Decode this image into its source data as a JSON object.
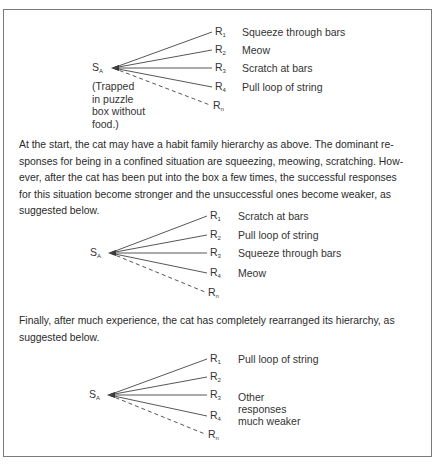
{
  "diagrams": [
    {
      "stimulus": {
        "base": "S",
        "sub": "A"
      },
      "note": [
        "(Trapped",
        "in puzzle",
        "box without",
        "food.)"
      ],
      "responses": [
        {
          "base": "R",
          "sub": "1",
          "text": "Squeeze through bars",
          "style": "solid"
        },
        {
          "base": "R",
          "sub": "2",
          "text": "Meow",
          "style": "solid"
        },
        {
          "base": "R",
          "sub": "3",
          "text": "Scratch at bars",
          "style": "solid"
        },
        {
          "base": "R",
          "sub": "4",
          "text": "Pull loop of string",
          "style": "solid"
        },
        {
          "base": "R",
          "sub": "n",
          "text": "",
          "style": "dashed"
        }
      ]
    },
    {
      "stimulus": {
        "base": "S",
        "sub": "A"
      },
      "responses": [
        {
          "base": "R",
          "sub": "1",
          "text": "Scratch at bars",
          "style": "solid"
        },
        {
          "base": "R",
          "sub": "2",
          "text": "Pull loop of string",
          "style": "solid"
        },
        {
          "base": "R",
          "sub": "3",
          "text": "Squeeze through bars",
          "style": "solid"
        },
        {
          "base": "R",
          "sub": "4",
          "text": "Meow",
          "style": "solid"
        },
        {
          "base": "R",
          "sub": "n",
          "text": "",
          "style": "dashed"
        }
      ]
    },
    {
      "stimulus": {
        "base": "S",
        "sub": "A"
      },
      "responses": [
        {
          "base": "R",
          "sub": "1",
          "text": "Pull loop of string",
          "style": "solid"
        },
        {
          "base": "R",
          "sub": "2",
          "text": "",
          "style": "solid"
        },
        {
          "base": "R",
          "sub": "3",
          "text": "",
          "style": "solid"
        },
        {
          "base": "R",
          "sub": "4",
          "text": "",
          "style": "solid"
        },
        {
          "base": "R",
          "sub": "n",
          "text": "",
          "style": "dashed"
        }
      ],
      "group_note": [
        "Other",
        "responses",
        "much weaker"
      ]
    }
  ],
  "paragraphs": [
    "At the start, the cat may have a habit family hierarchy as above. The dominant re-sponses for being in a confined situation are squeezing, meowing, scratching. How-ever, after the cat has been put into the box a few times, the successful responses for this situation become stronger and the unsuccessful ones become weaker, as suggested below.",
    "Finally, after much experience, the cat has completely rearranged its hierarchy, as suggested below."
  ],
  "paragraph_lines": [
    [
      "At the start, the cat may have a habit family hierarchy as above. The dominant re-",
      "sponses for being in a confined situation are squeezing, meowing, scratching. How-",
      "ever, after the cat has been put into the box a few times, the successful responses",
      "for this situation become stronger and the unsuccessful ones become weaker, as",
      "suggested below."
    ],
    [
      "Finally, after much experience, the cat has completely rearranged its hierarchy, as",
      "suggested below."
    ]
  ]
}
